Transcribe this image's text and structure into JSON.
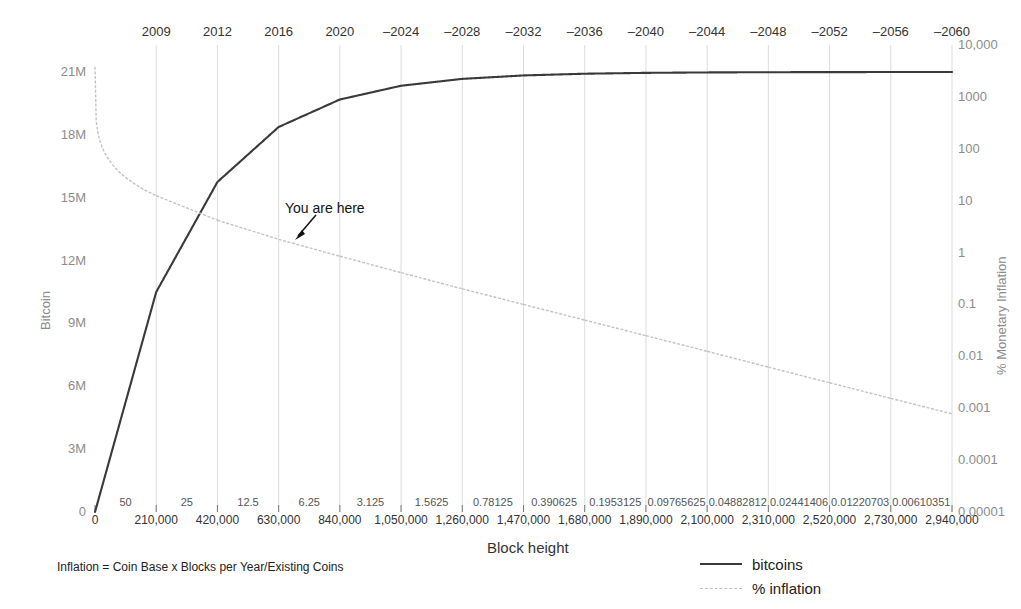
{
  "chart_data": {
    "type": "line",
    "title": "",
    "xlabel": "Block height",
    "ylabel": "Bitcoin",
    "y2label": "% Monetary Inflation",
    "grid": true,
    "legend_position": "bottom-right",
    "x_axis": {
      "block_heights": [
        "0",
        "210,000",
        "420,000",
        "630,000",
        "840,000",
        "1,050,000",
        "1,260,000",
        "1,470,000",
        "1,680,000",
        "1,890,000",
        "2,100,000",
        "2,310,000",
        "2,520,000",
        "2,730,000",
        "2,940,000"
      ],
      "block_subsidy": [
        "50",
        "25",
        "12.5",
        "6.25",
        "3.125",
        "1.5625",
        "0.78125",
        "0.390625",
        "0.1953125",
        "0.09765625",
        "0.04882812",
        "0.02441406",
        "0.01220703",
        "0.00610351"
      ],
      "years": [
        "2009",
        "2012",
        "2016",
        "2020",
        "–2024",
        "–2028",
        "–2032",
        "–2036",
        "–2040",
        "–2044",
        "–2048",
        "–2052",
        "–2056",
        "–2060"
      ]
    },
    "y_left": {
      "ticks": [
        "21M",
        "18M",
        "15M",
        "12M",
        "9M",
        "6M",
        "3M",
        "0"
      ],
      "values": [
        21000000,
        18000000,
        15000000,
        12000000,
        9000000,
        6000000,
        3000000,
        0
      ],
      "lim": [
        0,
        21000000
      ]
    },
    "y_right": {
      "scale": "log",
      "ticks": [
        "10,000",
        "1000",
        "100",
        "10",
        "1",
        "0.1",
        "0.01",
        "0.001",
        "0.0001",
        "0.00001"
      ],
      "values": [
        10000,
        1000,
        100,
        10,
        1,
        0.1,
        0.01,
        0.001,
        0.0001,
        1e-05
      ],
      "lim": [
        1e-05,
        10000
      ]
    },
    "series": [
      {
        "name": "bitcoins",
        "color": "#3a3a3a",
        "style": "solid",
        "axis": "left",
        "x": [
          0,
          210000,
          420000,
          630000,
          840000,
          1050000,
          1260000,
          1470000,
          1680000,
          1890000,
          2100000,
          2310000,
          2520000,
          2730000,
          2940000
        ],
        "values": [
          0,
          10500000,
          15750000,
          18375000,
          19687500,
          20343750,
          20671875,
          20835937,
          20917968,
          20958984,
          20979492,
          20989746,
          20994873,
          20997436,
          20998718
        ]
      },
      {
        "name": "% inflation",
        "color": "#c3c3c3",
        "style": "dashed",
        "axis": "right",
        "steps": [
          {
            "block_start": 0,
            "block_end": 210000,
            "start": 3800,
            "end": 12.5
          },
          {
            "block_start": 210000,
            "block_end": 420000,
            "start": 12.5,
            "end": 4.2
          },
          {
            "block_start": 420000,
            "block_end": 630000,
            "start": 4.2,
            "end": 1.8
          },
          {
            "block_start": 630000,
            "block_end": 840000,
            "start": 1.8,
            "end": 0.85
          },
          {
            "block_start": 840000,
            "block_end": 1050000,
            "start": 0.85,
            "end": 0.41
          },
          {
            "block_start": 1050000,
            "block_end": 1260000,
            "start": 0.41,
            "end": 0.2
          },
          {
            "block_start": 1260000,
            "block_end": 1470000,
            "start": 0.2,
            "end": 0.1
          },
          {
            "block_start": 1470000,
            "block_end": 1680000,
            "start": 0.1,
            "end": 0.05
          },
          {
            "block_start": 1680000,
            "block_end": 1890000,
            "start": 0.05,
            "end": 0.025
          },
          {
            "block_start": 1890000,
            "block_end": 2100000,
            "start": 0.025,
            "end": 0.0125
          },
          {
            "block_start": 2100000,
            "block_end": 2310000,
            "start": 0.0125,
            "end": 0.0062
          },
          {
            "block_start": 2310000,
            "block_end": 2520000,
            "start": 0.0062,
            "end": 0.0031
          },
          {
            "block_start": 2520000,
            "block_end": 2730000,
            "start": 0.0031,
            "end": 0.00155
          },
          {
            "block_start": 2730000,
            "block_end": 2940000,
            "start": 0.00155,
            "end": 0.00078
          }
        ]
      }
    ],
    "annotations": [
      {
        "name": "you-are-here",
        "text": "You are here",
        "arrow": "down-left"
      }
    ],
    "footnote": "Inflation = Coin Base x Blocks per Year/Existing Coins"
  },
  "legend": {
    "items": [
      {
        "label": "bitcoins",
        "style": "solid"
      },
      {
        "label": "% inflation",
        "style": "dashed"
      }
    ]
  },
  "colors": {
    "bitcoins": "#3a3a3a",
    "inflation": "#c3c3c3",
    "grid": "#dcdcdc",
    "axis_text": "#8c8c8c",
    "text": "#333333"
  }
}
